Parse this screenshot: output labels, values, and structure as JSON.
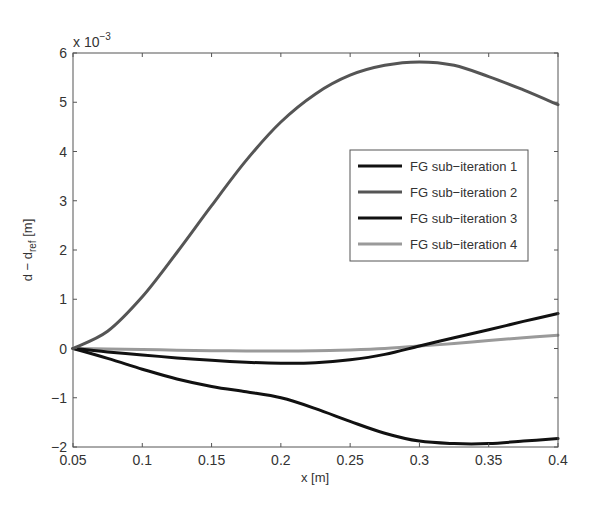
{
  "chart_data": {
    "type": "line",
    "title": "",
    "xlabel": "x [m]",
    "ylabel": "d − d_ref [m]",
    "ylabel_main": "d − d",
    "ylabel_sub": "ref",
    "ylabel_unit": " [m]",
    "y_multiplier": "x 10",
    "y_multiplier_exp": "−3",
    "xlim": [
      0.05,
      0.4
    ],
    "ylim": [
      -2,
      6
    ],
    "y_scale": 0.001,
    "grid": false,
    "legend_position": "inside-right",
    "x_ticks": [
      "0.05",
      "0.1",
      "0.15",
      "0.2",
      "0.25",
      "0.3",
      "0.35",
      "0.4"
    ],
    "y_ticks": [
      "−2",
      "−1",
      "0",
      "1",
      "2",
      "3",
      "4",
      "5",
      "6"
    ],
    "x": [
      0.05,
      0.075,
      0.1,
      0.125,
      0.15,
      0.175,
      0.2,
      0.225,
      0.25,
      0.275,
      0.3,
      0.325,
      0.35,
      0.375,
      0.4
    ],
    "series": [
      {
        "name": "FG sub−iteration 1",
        "color": "#111111",
        "values": [
          0.0,
          -0.07,
          -0.13,
          -0.19,
          -0.24,
          -0.28,
          -0.3,
          -0.29,
          -0.23,
          -0.12,
          0.05,
          0.22,
          0.38,
          0.55,
          0.71
        ]
      },
      {
        "name": "FG sub−iteration 2",
        "color": "#555555",
        "values": [
          0.0,
          0.35,
          1.05,
          1.95,
          2.9,
          3.82,
          4.6,
          5.17,
          5.55,
          5.75,
          5.82,
          5.75,
          5.52,
          5.25,
          4.95
        ]
      },
      {
        "name": "FG sub−iteration 3",
        "color": "#111111",
        "values": [
          0.0,
          -0.2,
          -0.42,
          -0.62,
          -0.77,
          -0.88,
          -1.0,
          -1.22,
          -1.48,
          -1.72,
          -1.88,
          -1.93,
          -1.93,
          -1.88,
          -1.83
        ]
      },
      {
        "name": "FG sub−iteration 4",
        "color": "#9a9a9a",
        "values": [
          0.0,
          -0.01,
          -0.02,
          -0.035,
          -0.045,
          -0.05,
          -0.05,
          -0.045,
          -0.03,
          0.0,
          0.05,
          0.1,
          0.16,
          0.22,
          0.27
        ]
      }
    ]
  }
}
